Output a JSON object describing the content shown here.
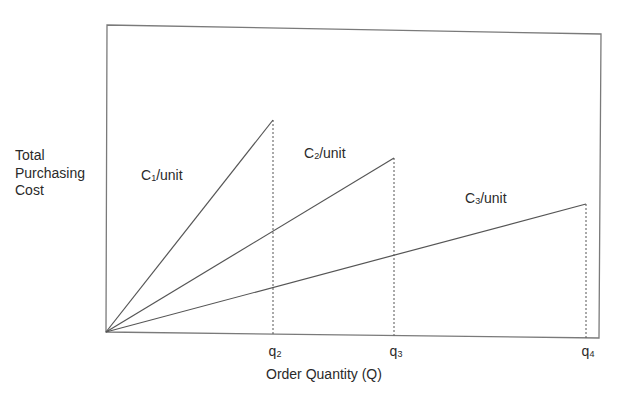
{
  "chart_data": {
    "type": "line",
    "title": "",
    "xlabel": "Order Quantity (Q)",
    "ylabel": "Total Purchasing Cost",
    "ylabel_lines": [
      "Total",
      "Purchasing",
      "Cost"
    ],
    "grid": false,
    "legend": "none (inline line labels)",
    "x_ticks": [
      {
        "base": "q",
        "sub": "2",
        "x": 167
      },
      {
        "base": "q",
        "sub": "3",
        "x": 288
      },
      {
        "base": "q",
        "sub": "4",
        "x": 480
      }
    ],
    "series": [
      {
        "name": "C1/unit",
        "base": "C",
        "sub": "1",
        "suffix": "/unit",
        "points": [
          [
            0,
            0
          ],
          [
            167,
            212
          ]
        ],
        "label_pos": [
          141,
          167
        ]
      },
      {
        "name": "C2/unit",
        "base": "C",
        "sub": "2",
        "suffix": "/unit",
        "points": [
          [
            0,
            0
          ],
          [
            288,
            174
          ]
        ],
        "label_pos": [
          304,
          145
        ]
      },
      {
        "name": "C3/unit",
        "base": "C",
        "sub": "3",
        "suffix": "/unit",
        "points": [
          [
            0,
            0
          ],
          [
            480,
            128
          ]
        ],
        "label_pos": [
          465,
          190
        ]
      }
    ],
    "dashed_verticals_at": [
      "q2",
      "q3",
      "q4"
    ]
  },
  "colors": {
    "line": "#555555",
    "frame": "#7a7a7a",
    "text": "#2a2a2a"
  }
}
